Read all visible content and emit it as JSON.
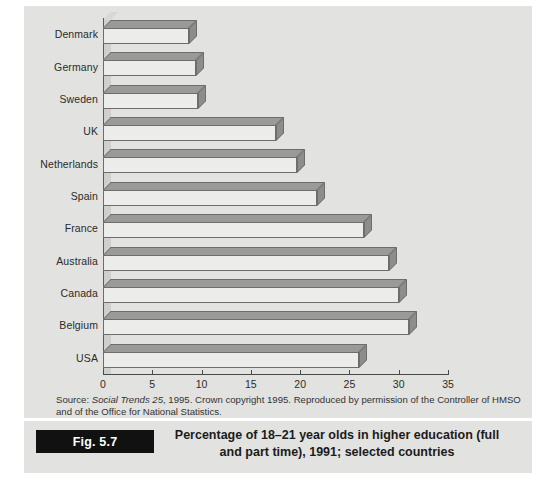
{
  "figure": {
    "badge_label": "Fig. 5.7",
    "caption_line1": "Percentage of 18–21 year olds in higher education (full",
    "caption_line2": "and part time), 1991; selected countries",
    "source_line1_prefix": "Source: ",
    "source_italic": "Social Trends 25",
    "source_line1_suffix": ", 1995. Crown copyright 1995. Reproduced by permission of the Controller of HMSO",
    "source_line2": "and of the Office for National Statistics."
  },
  "colors": {
    "panel_background": "#e2e2e0",
    "page_background": "#ffffff",
    "bar_face": "#ececeb",
    "bar_top": "#9a9a99",
    "bar_side": "#8d8d8c",
    "bar_outline": "#6d6d6d",
    "axis": "#4a4a4a",
    "badge": "#111111",
    "text": "#2b2b2b"
  },
  "chart_data": {
    "type": "bar",
    "orientation": "horizontal",
    "title": "Percentage of 18–21 year olds in higher education (full and part time), 1991; selected countries",
    "xlabel": "",
    "ylabel": "",
    "xlim": [
      0,
      35
    ],
    "xticks": [
      0,
      5,
      10,
      15,
      20,
      25,
      30,
      35
    ],
    "grid": false,
    "legend": false,
    "categories": [
      "Denmark",
      "Germany",
      "Sweden",
      "UK",
      "Netherlands",
      "Spain",
      "France",
      "Australia",
      "Canada",
      "Belgium",
      "USA"
    ],
    "values": [
      8.7,
      9.4,
      9.6,
      17.5,
      19.7,
      21.7,
      26.5,
      29.0,
      30.0,
      31.0,
      26.0
    ],
    "units": "percent"
  }
}
